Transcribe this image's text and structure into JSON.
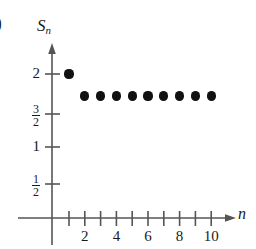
{
  "figure": {
    "part_label": "b)",
    "background_color": "#ffffff",
    "axis_color": "#555555",
    "point_color": "#111111"
  },
  "chart_data": {
    "type": "scatter",
    "title": "",
    "subtitle": "",
    "xlabel": "n",
    "ylabel": "S_n",
    "x": [
      1,
      2,
      3,
      4,
      5,
      6,
      7,
      8,
      9,
      10
    ],
    "values": [
      2,
      1.7,
      1.7,
      1.7,
      1.7,
      1.7,
      1.7,
      1.7,
      1.7,
      1.7
    ],
    "series": [
      {
        "name": "S_n",
        "x": [
          1,
          2,
          3,
          4,
          5,
          6,
          7,
          8,
          9,
          10
        ],
        "values": [
          2,
          1.7,
          1.7,
          1.7,
          1.7,
          1.7,
          1.7,
          1.7,
          1.7,
          1.7
        ]
      }
    ],
    "xlim": [
      0,
      11
    ],
    "ylim": [
      0,
      2.2
    ],
    "grid": false,
    "legend": "none",
    "xticks": [
      1,
      2,
      3,
      4,
      5,
      6,
      7,
      8,
      9,
      10
    ],
    "xtick_labels": [
      {
        "value": 2,
        "label": "2"
      },
      {
        "value": 4,
        "label": "4"
      },
      {
        "value": 6,
        "label": "6"
      },
      {
        "value": 8,
        "label": "8"
      },
      {
        "value": 10,
        "label": "10"
      }
    ],
    "yticks": [
      0.5,
      1,
      1.5,
      2
    ],
    "ytick_labels": [
      {
        "value": 2,
        "label": "2",
        "kind": "integer",
        "num": "2",
        "den": ""
      },
      {
        "value": 1.5,
        "label": "3/2",
        "kind": "fraction",
        "num": "3",
        "den": "2"
      },
      {
        "value": 1,
        "label": "1",
        "kind": "integer",
        "num": "1",
        "den": ""
      },
      {
        "value": 0.5,
        "label": "1/2",
        "kind": "fraction",
        "num": "1",
        "den": "2"
      }
    ]
  },
  "axis_labels": {
    "y_symbol": "S",
    "y_subscript": "n",
    "x_symbol": "n"
  },
  "ytick_text": {
    "t2": "2",
    "t32_num": "3",
    "t32_den": "2",
    "t1": "1",
    "t12_num": "1",
    "t12_den": "2"
  },
  "xtick_text": {
    "t2": "2",
    "t4": "4",
    "t6": "6",
    "t8": "8",
    "t10": "10"
  }
}
